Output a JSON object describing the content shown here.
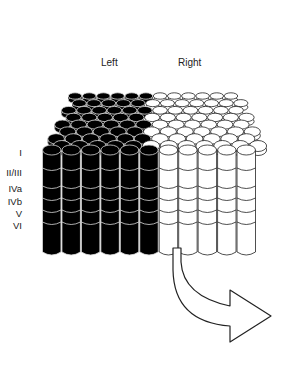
{
  "diagram": {
    "type": "ocular-dominance-columns",
    "column_labels": {
      "left": "Left",
      "right": "Right"
    },
    "layer_labels": [
      "I",
      "II/III",
      "IVa",
      "IVb",
      "V",
      "VI"
    ],
    "colors": {
      "left_eye": "#000000",
      "right_eye": "#ffffff",
      "outline": "#222222"
    },
    "arrow": {
      "direction": "down-then-right"
    }
  }
}
